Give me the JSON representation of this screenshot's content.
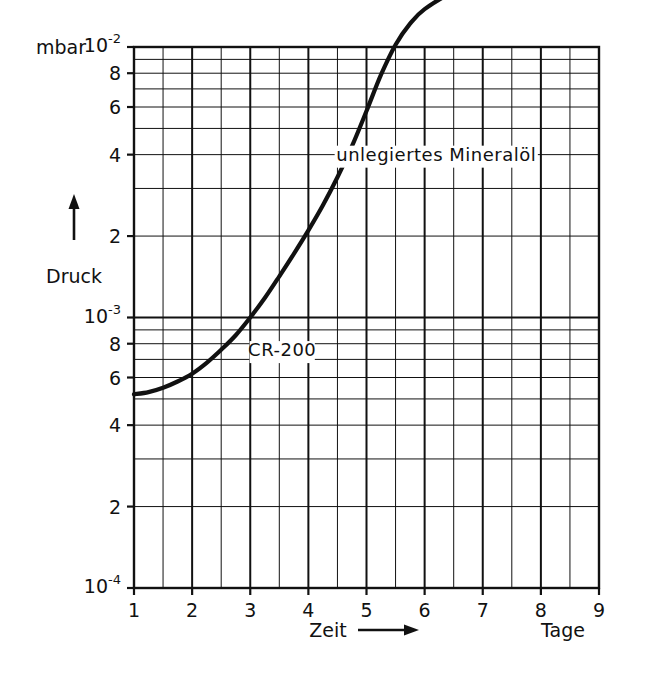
{
  "figure": {
    "unit_label": "mbar",
    "y_axis_label": "Druck",
    "x_axis_label": "Zeit",
    "x_axis_unit": "Tage",
    "arrow_glyph": "⟶"
  },
  "y_ticks": [
    {
      "label": "10",
      "exp": "-2",
      "value": 0.01,
      "major": true
    },
    {
      "label": "8",
      "exp": "",
      "value": 0.008,
      "major": false
    },
    {
      "label": "6",
      "exp": "",
      "value": 0.006,
      "major": false
    },
    {
      "label": "4",
      "exp": "",
      "value": 0.004,
      "major": false
    },
    {
      "label": "2",
      "exp": "",
      "value": 0.002,
      "major": false
    },
    {
      "label": "10",
      "exp": "-3",
      "value": 0.001,
      "major": true
    },
    {
      "label": "8",
      "exp": "",
      "value": 0.0008,
      "major": false
    },
    {
      "label": "6",
      "exp": "",
      "value": 0.0006,
      "major": false
    },
    {
      "label": "4",
      "exp": "",
      "value": 0.0004,
      "major": false
    },
    {
      "label": "2",
      "exp": "",
      "value": 0.0002,
      "major": false
    },
    {
      "label": "10",
      "exp": "-4",
      "value": 0.0001,
      "major": true
    }
  ],
  "x_ticks": [
    {
      "label": "1",
      "value": 1
    },
    {
      "label": "2",
      "value": 2
    },
    {
      "label": "3",
      "value": 3
    },
    {
      "label": "4",
      "value": 4
    },
    {
      "label": "5",
      "value": 5
    },
    {
      "label": "6",
      "value": 6
    },
    {
      "label": "7",
      "value": 7
    },
    {
      "label": "8",
      "value": 8
    },
    {
      "label": "9",
      "value": 9
    }
  ],
  "chart_data": {
    "type": "line",
    "title": "",
    "xlabel": "Zeit",
    "ylabel": "Druck",
    "x_unit": "Tage",
    "y_unit": "mbar",
    "yscale": "log",
    "xscale": "linear",
    "xlim": [
      1,
      9
    ],
    "ylim": [
      0.0001,
      0.01
    ],
    "grid": true,
    "legend": "inline-annotations",
    "series": [
      {
        "name": "unlegiertes Mineralöl",
        "label_x": 6.2,
        "label_y": 0.0038,
        "x": [
          1.0,
          1.25,
          1.5,
          1.75,
          2.0,
          2.25,
          2.5,
          2.75,
          3.0,
          3.25,
          3.5,
          3.75,
          4.0,
          4.25,
          4.5,
          4.75,
          5.0,
          5.5,
          6.0,
          6.5,
          7.0,
          7.5,
          8.0,
          8.5,
          9.0
        ],
        "y": [
          0.03,
          0.0268,
          0.0243,
          0.0225,
          0.0215,
          0.0211,
          0.021,
          0.0212,
          0.0217,
          0.0224,
          0.0233,
          0.024,
          0.0245,
          0.0247,
          0.0246,
          0.0243,
          0.024,
          0.0237,
          0.0236,
          0.0236,
          0.0236,
          0.0237,
          0.0238,
          0.0239,
          0.024
        ]
      },
      {
        "name": "CR-200",
        "label_x": 3.55,
        "label_y": 0.00072,
        "x": [
          1.0,
          1.25,
          1.5,
          1.75,
          2.0,
          2.25,
          2.5,
          2.75,
          3.0,
          3.25,
          3.5,
          3.75,
          4.0,
          4.25,
          4.5,
          4.75,
          5.0,
          5.25,
          5.5,
          5.75,
          6.0,
          6.5,
          7.0,
          7.5,
          8.0,
          8.5,
          9.0
        ],
        "y": [
          0.00052,
          0.00053,
          0.00055,
          0.00058,
          0.00062,
          0.00068,
          0.00076,
          0.00086,
          0.001,
          0.00118,
          0.00142,
          0.00172,
          0.0021,
          0.0026,
          0.0033,
          0.0043,
          0.0058,
          0.0079,
          0.0102,
          0.0122,
          0.0138,
          0.016,
          0.0175,
          0.0186,
          0.0195,
          0.0202,
          0.0209
        ]
      }
    ]
  }
}
